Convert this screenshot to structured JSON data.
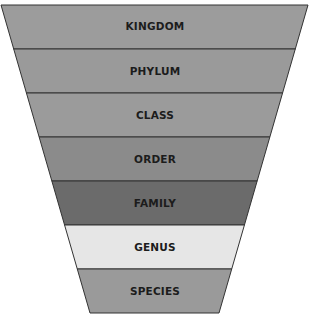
{
  "diagram": {
    "title": "",
    "type": "taxonomy-funnel",
    "levels": [
      {
        "label": "KINGDOM",
        "color": "#9c9c9c"
      },
      {
        "label": "PHYLUM",
        "color": "#9a9a9a"
      },
      {
        "label": "CLASS",
        "color": "#9b9b9b"
      },
      {
        "label": "ORDER",
        "color": "#8b8b8b"
      },
      {
        "label": "FAMILY",
        "color": "#6b6b6b"
      },
      {
        "label": "GENUS",
        "color": "#e6e6e6"
      },
      {
        "label": "SPECIES",
        "color": "#9a9a9a"
      }
    ],
    "border_color": "#333333"
  }
}
